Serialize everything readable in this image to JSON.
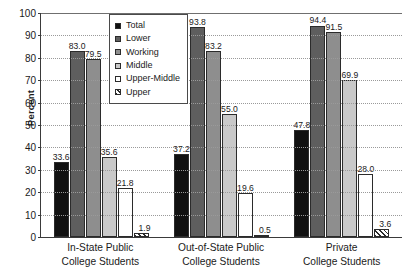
{
  "chart_data": {
    "type": "bar",
    "title": "",
    "subtitle": "",
    "xlabel": "",
    "ylabel": "Percent",
    "ylim": [
      0,
      100
    ],
    "ytick_step": 10,
    "yticks": [
      0,
      10,
      20,
      30,
      40,
      50,
      60,
      70,
      80,
      90,
      100
    ],
    "grid": true,
    "legend_position": "top-center-inside",
    "categories": [
      "In-State Public College Students",
      "Out-of-State Public College Students",
      "Private College Students"
    ],
    "category_lines": [
      [
        "In-State Public",
        "College Students"
      ],
      [
        "Out-of-State Public",
        "College Students"
      ],
      [
        "Private",
        "College Students"
      ]
    ],
    "series": [
      {
        "name": "Total",
        "color": "#111111",
        "pattern": "solid",
        "values": [
          33.6,
          37.2,
          47.8
        ]
      },
      {
        "name": "Lower",
        "color": "#5e5e5e",
        "pattern": "solid",
        "values": [
          83.0,
          93.8,
          94.4
        ]
      },
      {
        "name": "Working",
        "color": "#8e8e8e",
        "pattern": "solid",
        "values": [
          79.5,
          83.2,
          91.5
        ]
      },
      {
        "name": "Middle",
        "color": "#c9c9c9",
        "pattern": "solid",
        "values": [
          35.6,
          55.0,
          69.9
        ]
      },
      {
        "name": "Upper-Middle",
        "color": "#ffffff",
        "pattern": "solid",
        "values": [
          21.8,
          19.6,
          28.0
        ]
      },
      {
        "name": "Upper",
        "color": "#ffffff",
        "pattern": "hatch",
        "values": [
          1.9,
          0.5,
          3.6
        ]
      }
    ],
    "value_labels": [
      [
        "33.6",
        "83.0",
        "79.5",
        "35.6",
        "21.8",
        "1.9"
      ],
      [
        "37.2",
        "93.8",
        "83.2",
        "55.0",
        "19.6",
        "0.5"
      ],
      [
        "47.8",
        "94.4",
        "91.5",
        "69.9",
        "28.0",
        "3.6"
      ]
    ]
  },
  "axis": {
    "y_title": "Percent",
    "y_tick_labels": [
      "100",
      "90",
      "80",
      "70",
      "60",
      "50",
      "40",
      "30",
      "20",
      "10",
      "0"
    ]
  },
  "legend": {
    "items": [
      {
        "label": "Total"
      },
      {
        "label": "Lower"
      },
      {
        "label": "Working"
      },
      {
        "label": "Middle"
      },
      {
        "label": "Upper-Middle"
      },
      {
        "label": "Upper"
      }
    ]
  }
}
